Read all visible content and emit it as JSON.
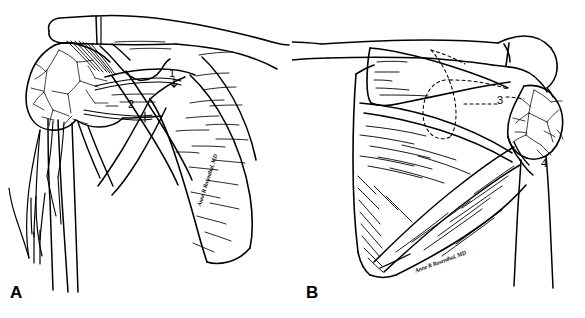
{
  "figure": {
    "style": "black-and-white pen-and-ink medical line drawing",
    "background_color": "#ffffff",
    "ink_color": "#000000",
    "panels": [
      {
        "letter": "A",
        "view": "anterior",
        "description": "Anterior view of the shoulder showing clavicle, coracoid process, humeral head with vascular cancellous texture, subscapularis, and scapula body"
      },
      {
        "letter": "B",
        "view": "posterior",
        "description": "Posterior view of the scapula showing spine of scapula, supraspinous and infraspinous fossae, dashed glenoid outline, and humeral head"
      }
    ],
    "labels": [
      {
        "id": "1",
        "panel": "A",
        "leader": "arrow"
      },
      {
        "id": "2",
        "panel": "A",
        "leader": "tick"
      },
      {
        "id": "3",
        "panel": "B",
        "leader": "dashed"
      },
      {
        "id": "4",
        "panel": "B",
        "leader": "none"
      }
    ],
    "signature": {
      "text": "Anne R Rosenthal, MD",
      "panel_a_rotation_deg": -72,
      "panel_b_rotation_deg": -20
    }
  }
}
